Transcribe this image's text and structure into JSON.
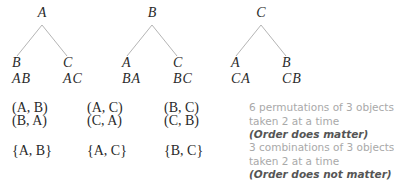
{
  "trees": [
    {
      "root": "A",
      "leaves": [
        {
          "label": "B",
          "pair": "AB"
        },
        {
          "label": "C",
          "pair": "AC"
        }
      ]
    },
    {
      "root": "B",
      "leaves": [
        {
          "label": "A",
          "pair": "BA"
        },
        {
          "label": "C",
          "pair": "BC"
        }
      ]
    },
    {
      "root": "C",
      "leaves": [
        {
          "label": "A",
          "pair": "CA"
        },
        {
          "label": "B",
          "pair": "CB"
        }
      ]
    }
  ],
  "ordered_pairs": [
    {
      "top": "(A, B)",
      "bottom": "(B, A)"
    },
    {
      "top": "(A, C)",
      "bottom": "(C, A)"
    },
    {
      "top": "(B, C)",
      "bottom": "(C, B)"
    }
  ],
  "sets": [
    "{A, B}",
    "{A, C}",
    "{B, C}"
  ],
  "notes": {
    "permutations_line1": "6 permutations of 3 objects",
    "permutations_line2": "taken 2 at a time",
    "permutations_order": "(Order does matter)",
    "combinations_line1": "3 combinations of 3 objects",
    "combinations_line2": "taken 2 at a time",
    "combinations_order": "(Order does not matter)"
  },
  "colors": {
    "line": "#b5b5b5",
    "text": "#2a2a2a",
    "note_gray": "#a9a9a9",
    "note_dark": "#555555"
  }
}
